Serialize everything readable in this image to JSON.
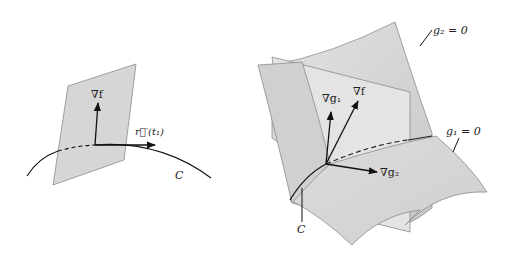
{
  "left_figure": {
    "plane_label": "tangent plane",
    "gradient_label": "∇f",
    "tangent_label": "r⃗′(t₁)",
    "curve_label": "C",
    "colors": {
      "plane_fill": "#d6d6d6",
      "plane_stroke": "#888888",
      "ink": "#111111"
    }
  },
  "right_figure": {
    "surface_g2_label": "g₂ = 0",
    "surface_g1_label": "g₁ = 0",
    "grad_g1_label": "∇g₁",
    "grad_f_label": "∇f",
    "grad_g2_label": "∇g₂",
    "curve_label": "C",
    "colors": {
      "surface_fill": "#d9d9d9",
      "surface_light": "#e6e6e6",
      "surface_stroke": "#8a8a8a",
      "ink": "#111111"
    }
  }
}
